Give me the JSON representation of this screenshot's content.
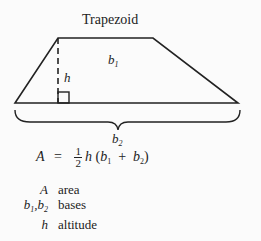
{
  "title": "Trapezoid",
  "labels": {
    "b1": {
      "base": "b",
      "sub": "1"
    },
    "h": "h",
    "b2": {
      "base": "b",
      "sub": "2"
    }
  },
  "formula": {
    "lhs": "A",
    "eq": "=",
    "frac_num": "1",
    "frac_den": "2",
    "rhs": "h (b1 + b2)"
  },
  "legend": [
    {
      "symbol": "A",
      "meaning": "area"
    },
    {
      "symbol": "b1,b2",
      "meaning": "bases"
    },
    {
      "symbol": "h",
      "meaning": "altitude"
    }
  ],
  "colors": {
    "line": "#222222",
    "background": "#fbfbfb"
  }
}
